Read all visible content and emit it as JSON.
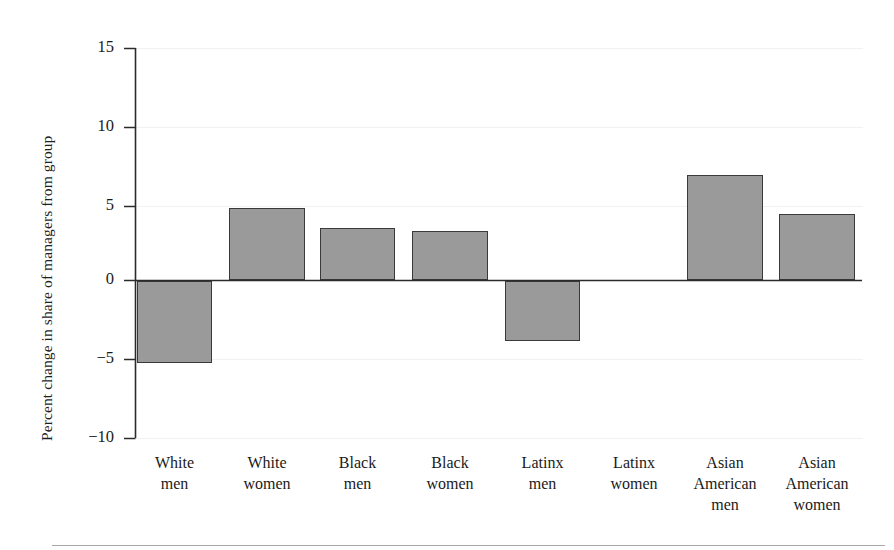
{
  "chart_data": {
    "type": "bar",
    "title": "",
    "subtitle": "",
    "xlabel": "",
    "ylabel": "Percent change in share of managers from group",
    "categories": [
      "White men",
      "White women",
      "Black men",
      "Black women",
      "Latinx men",
      "Latinx women",
      "Asian American men",
      "Asian American women"
    ],
    "category_lines": [
      [
        "White",
        "men"
      ],
      [
        "White",
        "women"
      ],
      [
        "Black",
        "men"
      ],
      [
        "Black",
        "women"
      ],
      [
        "Latinx",
        "men"
      ],
      [
        "Latinx",
        "women"
      ],
      [
        "Asian",
        "American",
        "men"
      ],
      [
        "Asian",
        "American",
        "women"
      ]
    ],
    "values": [
      -5.3,
      4.7,
      3.4,
      3.2,
      -3.9,
      0,
      6.8,
      4.3
    ],
    "ylim": [
      -10,
      15
    ],
    "yticks": [
      15,
      10,
      5,
      0,
      -5,
      -10
    ],
    "ytick_labels": [
      "15",
      "10",
      "5",
      "0",
      "−5",
      "−10"
    ],
    "grid": true,
    "grid_axis": "y",
    "legend": null,
    "bar_fill_color": "#9a9a9a",
    "bar_edge_color": "#3a3a3a",
    "axis_color": "#2b2b2b",
    "gridline_color": "#f1f1f1",
    "zero_line_value": 0
  }
}
